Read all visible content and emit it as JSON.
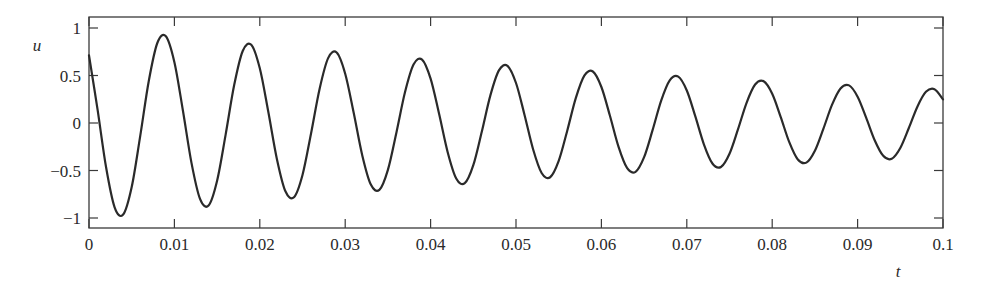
{
  "chart_data": {
    "type": "line",
    "title": "",
    "xlabel": "t",
    "ylabel": "u",
    "xlim": [
      0,
      0.1
    ],
    "ylim": [
      -1.1,
      1.1
    ],
    "grid": false,
    "legend": null,
    "x_ticks": [
      0,
      0.01,
      0.02,
      0.03,
      0.04,
      0.05,
      0.06,
      0.07,
      0.08,
      0.09,
      0.1
    ],
    "x_tick_labels": [
      "0",
      "0.01",
      "0.02",
      "0.03",
      "0.04",
      "0.05",
      "0.06",
      "0.07",
      "0.08",
      "0.09",
      "0.1"
    ],
    "y_ticks": [
      1,
      0.5,
      0,
      -0.5,
      -1
    ],
    "y_tick_labels": [
      "1",
      "0.5",
      "0",
      "−0.5",
      "−1"
    ],
    "model_fit": {
      "amplitude": 1.02,
      "decay_rate": 10.5,
      "frequency_hz": 100,
      "phase_rad": 0.8
    },
    "peaks": [
      {
        "t": 0.0087,
        "u": 0.93
      },
      {
        "t": 0.0187,
        "u": 0.83
      },
      {
        "t": 0.0287,
        "u": 0.75
      },
      {
        "t": 0.0387,
        "u": 0.67
      },
      {
        "t": 0.0487,
        "u": 0.6
      },
      {
        "t": 0.0587,
        "u": 0.55
      },
      {
        "t": 0.0687,
        "u": 0.49
      },
      {
        "t": 0.0787,
        "u": 0.45
      },
      {
        "t": 0.0887,
        "u": 0.4
      },
      {
        "t": 0.0987,
        "u": 0.36
      }
    ],
    "troughs": [
      {
        "t": 0.0037,
        "u": -0.96
      },
      {
        "t": 0.0137,
        "u": -0.87
      },
      {
        "t": 0.0237,
        "u": -0.78
      },
      {
        "t": 0.0337,
        "u": -0.71
      },
      {
        "t": 0.0437,
        "u": -0.63
      },
      {
        "t": 0.0537,
        "u": -0.58
      },
      {
        "t": 0.0637,
        "u": -0.52
      },
      {
        "t": 0.0737,
        "u": -0.47
      },
      {
        "t": 0.0837,
        "u": -0.42
      },
      {
        "t": 0.0937,
        "u": -0.38
      }
    ],
    "series": [
      {
        "name": "u(t)",
        "color": "#2a2a2a",
        "x_start": 0,
        "x_step": 0.001,
        "values": [
          0.711,
          0.143,
          -0.466,
          -0.887,
          -0.964,
          -0.674,
          -0.136,
          0.442,
          0.842,
          0.914,
          0.64,
          0.129,
          -0.42,
          -0.799,
          -0.868,
          -0.607,
          -0.122,
          0.399,
          0.758,
          0.824,
          0.576,
          0.116,
          -0.378,
          -0.719,
          -0.782,
          -0.547,
          -0.11,
          0.359,
          0.683,
          0.742,
          0.519,
          0.105,
          -0.341,
          -0.648,
          -0.704,
          -0.493,
          -0.099,
          0.323,
          0.615,
          0.668,
          0.467,
          0.094,
          -0.307,
          -0.584,
          -0.634,
          -0.444,
          -0.089,
          0.291,
          0.554,
          0.602,
          0.421,
          0.085,
          -0.276,
          -0.526,
          -0.571,
          -0.399,
          -0.081,
          0.262,
          0.499,
          0.542,
          0.379,
          0.076,
          -0.249,
          -0.473,
          -0.514,
          -0.36,
          -0.073,
          0.236,
          0.449,
          0.488,
          0.342,
          0.069,
          -0.224,
          -0.426,
          -0.463,
          -0.324,
          -0.065,
          0.213,
          0.405,
          0.439,
          0.308,
          0.062,
          -0.202,
          -0.384,
          -0.417,
          -0.292,
          -0.059,
          0.191,
          0.364,
          0.396,
          0.277,
          0.056,
          -0.182,
          -0.346,
          -0.376,
          -0.263,
          -0.053,
          0.172,
          0.328,
          0.356,
          0.249
        ]
      }
    ]
  },
  "layout": {
    "plot_left": 89,
    "plot_right": 943,
    "plot_top": 17,
    "plot_bottom": 228,
    "y_zero_px": 123,
    "y_unit_px": 95,
    "frame_color": "#3a3a3a",
    "line_color": "#2a2a2a"
  }
}
